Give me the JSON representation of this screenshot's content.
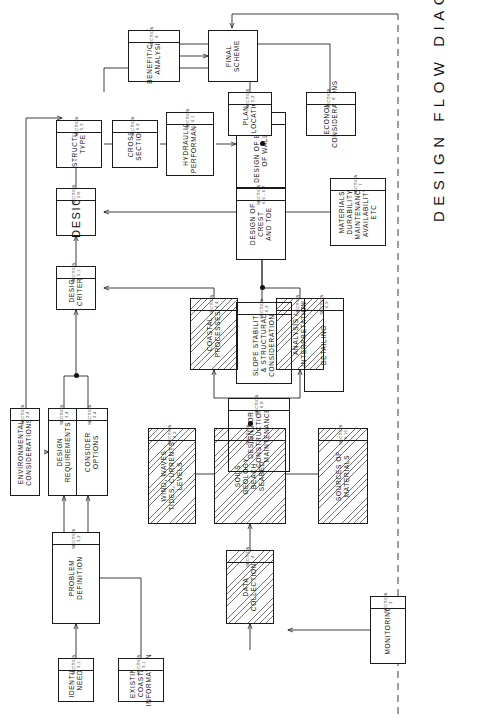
{
  "document": {
    "title": "DESIGN FLOW DIAGRAM",
    "orientation": "landscape-rotated-90ccw",
    "line_color": "#1a1a1a",
    "background": "#ffffff"
  },
  "nodes": {
    "identify_need": {
      "label": "IDENTIFY\nNEED",
      "section": "SECTION 3.1"
    },
    "problem_definition": {
      "label": "PROBLEM\nDEFINITION",
      "section": "SECTION 3.2"
    },
    "existing_coastal": {
      "label": "EXISTING COASTAL\nINFORMATION",
      "section": "SECTION 3.1"
    },
    "consider_options": {
      "label": "CONSIDER\nOPTIONS",
      "section": "SECTION 3.4"
    },
    "environmental": {
      "label": "ENVIRONMENTAL\nCONSIDERATIONS",
      "section": "SECTION 3.4"
    },
    "design_requirements": {
      "label": "DESIGN\nREQUIREMENTS",
      "section": "SECTION 3.4"
    },
    "monitoring": {
      "label": "MONITORING",
      "section": "SECTION 2"
    },
    "data_collection": {
      "label": "DATA\nCOLLECTION",
      "section": "SECTION 4"
    },
    "wind_waves": {
      "label": "WIND, WAVES\nTIDES, CURRENTS\nLEVELS",
      "section": "SECTION 4.2"
    },
    "soils_geology": {
      "label": "SOILS\nGEOLOGY\nBEACH\nSEABED",
      "section": "SECTION 4.3 - 4.4"
    },
    "sources_materials": {
      "label": "SOURCES OF\nMATERIALS",
      "section": "SECTION 4.10"
    },
    "coastal_processes": {
      "label": "COASTAL\nPROCESSES",
      "section": "SECTION 4.4"
    },
    "analysis_interp": {
      "label": "ANALYSIS /\nINTERPRETATION",
      "section": "SECTION 4.11"
    },
    "design_criteria": {
      "label": "DESIGN\nCRITERIA",
      "section": "SECTION 5.1"
    },
    "design": {
      "label": "DESIGN",
      "section": "SECTION 5/6"
    },
    "materials": {
      "label": "MATERIALS\nDURABILITY\nMAINTENANCE\nAVAILABILITY ETC",
      "section": "SECTION 7"
    },
    "plan_location": {
      "label": "PLAN/\nLOCATION",
      "section": "SECTION 5.2"
    },
    "economic": {
      "label": "ECONOMIC\nCONSIDERATIONS",
      "section": "SECTION 8"
    },
    "structure_type": {
      "label": "STRUCTURE\nTYPE",
      "section": "SECTION 5.3"
    },
    "cross_section": {
      "label": "CROSS\nSECTION",
      "section": "SECTION 6.2"
    },
    "hydraulic": {
      "label": "HYDRAULIC\nPERFORMANCE",
      "section": "SECTION 6.1"
    },
    "body_of_wall": {
      "label": "DESIGN OF BODY\nOF WALL",
      "section": "SECTION 6.3 - 6.5"
    },
    "crest_toe": {
      "label": "DESIGN OF CREST\nAND TOE",
      "section": "SECTION 6.6 - 6.7"
    },
    "slope_stability": {
      "label": "SLOPE STABILITY\n& STRUCTURAL\nCONSIDERATIONS",
      "section": "SECTION 6.2"
    },
    "detailing": {
      "label": "DETAILING",
      "section": "SECTION 6.9"
    },
    "design_construction": {
      "label": "DESIGN FOR\nCONSTRUCTION /\nMAINTENANCE",
      "section": "SECTION 6.8"
    },
    "benefit_cost": {
      "label": "BENEFIT/COST\nANALYSIS",
      "section": "SECTION 8"
    },
    "final_scheme": {
      "label": "FINAL\nSCHEME",
      "section": ""
    }
  }
}
